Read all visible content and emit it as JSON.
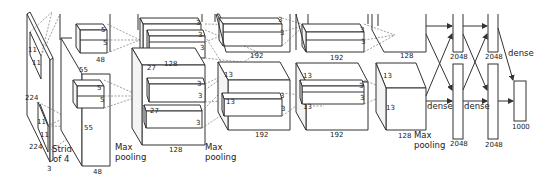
{
  "diagram": {
    "input": {
      "height": "224",
      "width": "224",
      "channels": "3",
      "kernel_h": "11",
      "kernel_w": "11",
      "stride_label_1": "Stride",
      "stride_label_2": "of 4"
    },
    "conv1": {
      "size": "55",
      "depth_top": "48",
      "depth_bottom": "48",
      "kernel_a": "5",
      "kernel_b": "5",
      "kernel_c": "5",
      "kernel_d": "5",
      "pool_1": "Max",
      "pool_2": "pooling"
    },
    "conv2": {
      "size_top": "27",
      "size_bottom": "27",
      "depth_top": "128",
      "depth_bottom": "128",
      "kernels": [
        "3",
        "3",
        "3",
        "3",
        "3",
        "3"
      ],
      "pool_1": "Max",
      "pool_2": "pooling"
    },
    "conv3": {
      "size": "13",
      "depth_top": "192",
      "depth_bottom": "192",
      "kernels": [
        "3",
        "3",
        "3",
        "3"
      ],
      "size_side": "13"
    },
    "conv4": {
      "size": "13",
      "size_side": "13",
      "depth_top": "192",
      "depth_bottom": "192",
      "kernels": [
        "3",
        "3",
        "3",
        "3"
      ]
    },
    "conv5": {
      "size": "13",
      "size_side": "13",
      "depth_top": "128",
      "depth_bottom": "128",
      "pool_1": "Max",
      "pool_2": "pooling"
    },
    "fc6": {
      "top": "2048",
      "bottom": "2048",
      "label": "dense"
    },
    "fc7": {
      "top": "2048",
      "bottom": "2048",
      "label": "dense"
    },
    "fc8": {
      "output": "1000",
      "label": "dense"
    }
  }
}
